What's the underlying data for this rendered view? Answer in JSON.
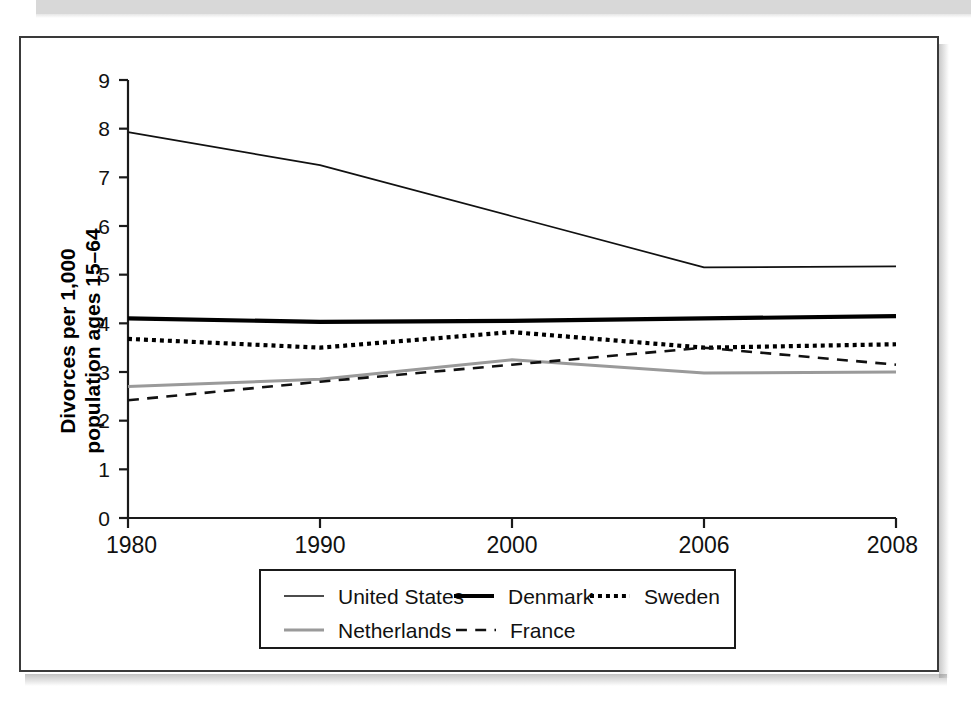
{
  "chart_data": {
    "type": "line",
    "title": "",
    "subtitle": "",
    "xlabel": "",
    "ylabel": "Divorces per 1,000 population ages 15–64",
    "ylabel_line1": "Divorces per 1,000",
    "ylabel_line2": "population ages 15–64",
    "categories": [
      "1980",
      "1990",
      "2000",
      "2006",
      "2008"
    ],
    "x_tick_labels": [
      "1980",
      "1990",
      "2000",
      "2006",
      "2008"
    ],
    "y_tick_labels": [
      "0",
      "1",
      "2",
      "3",
      "4",
      "5",
      "6",
      "7",
      "8",
      "9"
    ],
    "y_ticks": [
      0,
      1,
      2,
      3,
      4,
      5,
      6,
      7,
      8,
      9
    ],
    "ylim": [
      0,
      9
    ],
    "grid": false,
    "legend_position": "bottom",
    "series": [
      {
        "name": "United States",
        "values": [
          7.93,
          7.25,
          6.2,
          5.15,
          5.17
        ],
        "color": "#111111",
        "style": "solid",
        "width": 1.7
      },
      {
        "name": "Denmark",
        "values": [
          4.1,
          4.03,
          4.05,
          4.1,
          4.15
        ],
        "color": "#000000",
        "style": "solid",
        "width": 4.2
      },
      {
        "name": "Sweden",
        "values": [
          3.68,
          3.5,
          3.82,
          3.5,
          3.57
        ],
        "color": "#000000",
        "style": "dotted",
        "width": 4.2
      },
      {
        "name": "Netherlands",
        "values": [
          2.7,
          2.85,
          3.25,
          2.98,
          3.0
        ],
        "color": "#9a9a9a",
        "style": "solid",
        "width": 3.0
      },
      {
        "name": "France",
        "values": [
          2.42,
          2.8,
          3.15,
          3.5,
          3.15
        ],
        "color": "#111111",
        "style": "dashed",
        "width": 2.6
      }
    ],
    "legend": [
      {
        "label": "United States",
        "style": "solid",
        "color": "#111111",
        "width": 1.7
      },
      {
        "label": "Denmark",
        "style": "solid",
        "color": "#000000",
        "width": 4.2
      },
      {
        "label": "Sweden",
        "style": "dotted",
        "color": "#000000",
        "width": 4.2
      },
      {
        "label": "Netherlands",
        "style": "solid",
        "color": "#9a9a9a",
        "width": 3.0
      },
      {
        "label": "France",
        "style": "dashed",
        "color": "#111111",
        "width": 2.6
      }
    ]
  },
  "figure": {
    "border_color": "#3a3a3a",
    "background": "#ffffff"
  }
}
